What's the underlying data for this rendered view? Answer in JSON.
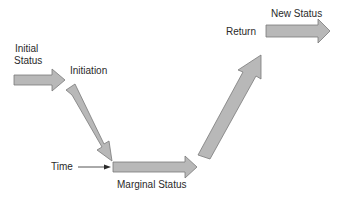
{
  "diagram": {
    "type": "status-transition-flow",
    "colors": {
      "arrow_fill": "#b8b8b8",
      "arrow_stroke": "#7a7a7a",
      "text": "#2a2a2a",
      "background": "#ffffff"
    },
    "labels": {
      "initial_status_line1": "Initial",
      "initial_status_line2": "Status",
      "initiation": "Initiation",
      "time": "Time",
      "marginal_status": "Marginal Status",
      "return": "Return",
      "new_status": "New Status"
    },
    "arrows": [
      {
        "id": "initial-status-arrow",
        "direction": "right"
      },
      {
        "id": "initiation-arrow",
        "direction": "down-right"
      },
      {
        "id": "marginal-status-arrow",
        "direction": "right"
      },
      {
        "id": "return-arrow",
        "direction": "up-right"
      },
      {
        "id": "new-status-arrow",
        "direction": "right"
      }
    ]
  }
}
